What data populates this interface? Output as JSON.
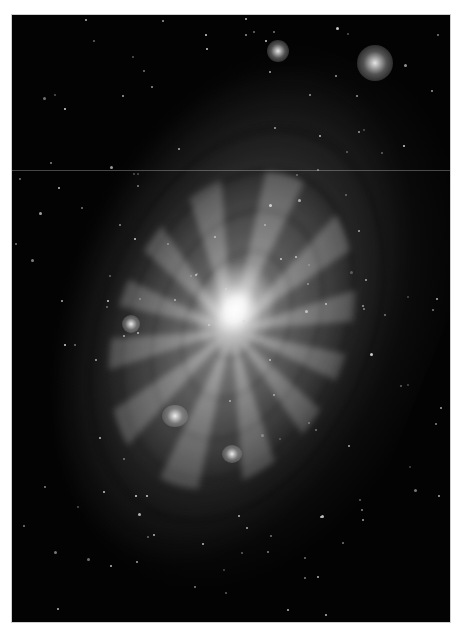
{
  "image": {
    "subject": "spiral galaxy",
    "description": "Grayscale astronomical photograph of a face-on tilted spiral galaxy with a bright central core, flocculent spiral arms, dust lanes, and scattered foreground stars on a black background, framed by a white border.",
    "color_mode": "grayscale",
    "colors": {
      "frame": "#ffffff",
      "background_space": "#030303",
      "core": "#ffffff",
      "disk": "#8a8a8a"
    }
  }
}
